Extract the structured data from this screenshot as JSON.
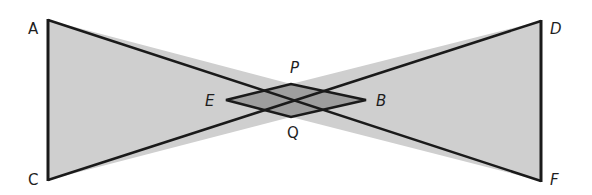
{
  "diagram": {
    "type": "geometry-bowtie",
    "colors": {
      "outer_fill": "#cfcfcf",
      "inner_fill": "#9e9e9e",
      "stroke": "#1a1a1a",
      "label": "#1e1e1e"
    },
    "points": {
      "A": {
        "label": "A",
        "x": 48,
        "y": 20
      },
      "C": {
        "label": "C",
        "x": 48,
        "y": 180
      },
      "D": {
        "label": "D",
        "x": 541,
        "y": 21
      },
      "F": {
        "label": "F",
        "x": 541,
        "y": 181
      },
      "P": {
        "label": "P",
        "x": 291,
        "y": 84
      },
      "Q": {
        "label": "Q",
        "x": 291,
        "y": 117
      },
      "E": {
        "label": "E",
        "x": 226,
        "y": 100
      },
      "B": {
        "label": "B",
        "x": 366,
        "y": 100
      }
    },
    "labels": {
      "A": "A",
      "C": "C",
      "D": "D",
      "F": "F",
      "P": "P",
      "Q": "Q",
      "E": "E",
      "B": "B"
    },
    "segments": [
      "AD",
      "CF",
      "AC",
      "DF",
      "EP",
      "PB",
      "EQ",
      "QB"
    ]
  }
}
